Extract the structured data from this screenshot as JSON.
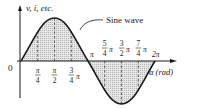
{
  "diagram": {
    "y_axis_label": "v, i, etc.",
    "x_axis_label": "α (rad)",
    "curve_label": "Sine wave",
    "origin_label": "0",
    "ticks_upper": [
      {
        "num": "π",
        "den": "4",
        "suffix": ""
      },
      {
        "num": "π",
        "den": "2",
        "suffix": ""
      },
      {
        "num": "3",
        "den": "4",
        "suffix": "π"
      }
    ],
    "pi_label": "π",
    "ticks_lower": [
      {
        "num": "5",
        "den": "4",
        "suffix": "π"
      },
      {
        "num": "3",
        "den": "2",
        "suffix": "π"
      },
      {
        "num": "7",
        "den": "4",
        "suffix": "π"
      }
    ],
    "two_pi_label": "2π",
    "colors": {
      "line": "#1a1a1a",
      "fill": "#d9d9d9",
      "background": "#ffffff"
    }
  }
}
